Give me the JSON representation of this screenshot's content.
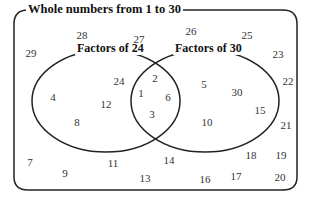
{
  "universal_set": {
    "label": "Whole numbers from 1 to 30"
  },
  "sets": [
    {
      "label": "Factors of 24"
    },
    {
      "label": "Factors of 30"
    }
  ],
  "regions": {
    "only_24": [
      "24",
      "4",
      "12",
      "8"
    ],
    "both": [
      "2",
      "1",
      "6",
      "3"
    ],
    "only_30": [
      "5",
      "30",
      "15",
      "10"
    ],
    "outside": [
      "28",
      "27",
      "29",
      "26",
      "25",
      "23",
      "22",
      "21",
      "7",
      "9",
      "11",
      "13",
      "14",
      "16",
      "17",
      "18",
      "19",
      "20"
    ]
  },
  "colors": {
    "line": "#222222",
    "text": "#333333"
  }
}
